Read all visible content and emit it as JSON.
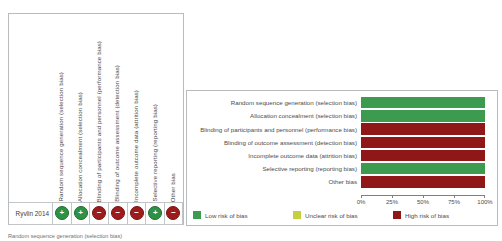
{
  "figure": {
    "caption": "Random sequence generation (selection bias)"
  },
  "domains": [
    "Random sequence generation (selection bias)",
    "Allocation concealment (selection bias)",
    "Blinding of participants and personnel (performance bias)",
    "Blinding of outcome assessment (detection bias)",
    "Incomplete outcome data (attrition bias)",
    "Selective reporting (reporting bias)",
    "Other bias"
  ],
  "summary": {
    "study": "Ryvlin 2014",
    "judgements": [
      {
        "domain": "Random sequence generation (selection bias)",
        "level": "low",
        "symbol": "+"
      },
      {
        "domain": "Allocation concealment (selection bias)",
        "level": "low",
        "symbol": "+"
      },
      {
        "domain": "Blinding of participants and personnel (performance bias)",
        "level": "high",
        "symbol": "−"
      },
      {
        "domain": "Blinding of outcome assessment (detection bias)",
        "level": "high",
        "symbol": "−"
      },
      {
        "domain": "Incomplete outcome data (attrition bias)",
        "level": "high",
        "symbol": "−"
      },
      {
        "domain": "Selective reporting (reporting bias)",
        "level": "low",
        "symbol": "+"
      },
      {
        "domain": "Other bias",
        "level": "high",
        "symbol": "−"
      }
    ]
  },
  "legend": [
    {
      "label": "Low risk of bias",
      "level": "low",
      "color": "#3d9b4f"
    },
    {
      "label": "Unclear risk of bias",
      "level": "unclear",
      "color": "#c6cf3e"
    },
    {
      "label": "High risk of bias",
      "level": "high",
      "color": "#8f1717"
    }
  ],
  "chart_data": {
    "type": "bar",
    "title": "",
    "xlabel": "",
    "ylabel": "",
    "orientation": "horizontal",
    "stacked": true,
    "xlim": [
      0,
      100
    ],
    "grid": false,
    "legend_position": "bottom",
    "tick_labels": [
      "0%",
      "25%",
      "50%",
      "75%",
      "100%"
    ],
    "tick_values": [
      0,
      25,
      50,
      75,
      100
    ],
    "categories": [
      "Random sequence generation (selection bias)",
      "Allocation concealment (selection bias)",
      "Blinding of participants and personnel (performance bias)",
      "Blinding of outcome assessment (detection bias)",
      "Incomplete outcome data (attrition bias)",
      "Selective reporting (reporting bias)",
      "Other bias"
    ],
    "series": [
      {
        "name": "Low risk of bias",
        "color": "#3d9b4f",
        "values": [
          100,
          100,
          0,
          0,
          0,
          100,
          0
        ]
      },
      {
        "name": "Unclear risk of bias",
        "color": "#c6cf3e",
        "values": [
          0,
          0,
          0,
          0,
          0,
          0,
          0
        ]
      },
      {
        "name": "High risk of bias",
        "color": "#8f1717",
        "values": [
          0,
          0,
          100,
          100,
          100,
          0,
          100
        ]
      }
    ]
  }
}
